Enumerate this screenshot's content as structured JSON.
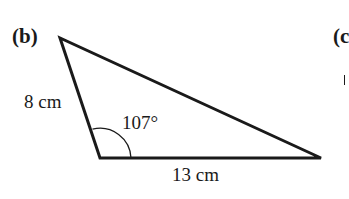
{
  "figure": {
    "part_label": "(b)",
    "next_part_label": "(c",
    "triangle": {
      "vertices": {
        "top": [
          60,
          38
        ],
        "bottom_left": [
          100,
          158
        ],
        "bottom_right": [
          321,
          158
        ]
      },
      "side_left_label": "8 cm",
      "side_bottom_label": "13 cm",
      "angle_label": "107°",
      "stroke_color": "#1a1a1a"
    }
  }
}
